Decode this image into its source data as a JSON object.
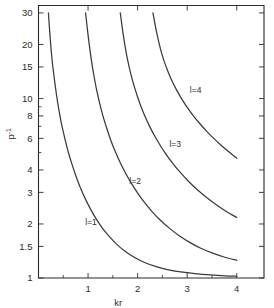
{
  "chart_data": {
    "type": "line",
    "title": "",
    "xlabel": "kr",
    "ylabel": "p⁻¹",
    "ylabel_base": "p",
    "ylabel_exponent": "-1",
    "xscale": "linear",
    "yscale": "log",
    "xlim": [
      0,
      4.55
    ],
    "ylim": [
      1,
      33
    ],
    "grid": false,
    "legend_position": "inline-curve-labels",
    "x_ticks_major": [
      1,
      2,
      3,
      4
    ],
    "x_tick_labels": [
      "1",
      "2",
      "3",
      "4"
    ],
    "x_ticks_minor": [
      0.5,
      1.5,
      2.5,
      3.5
    ],
    "y_ticks_major": [
      1,
      1.5,
      2,
      3,
      4,
      6,
      8,
      10,
      15,
      20,
      30
    ],
    "y_tick_labels": [
      "1",
      "1.5",
      "2",
      "3",
      "4",
      "6",
      "8",
      "10",
      "15",
      "20",
      "30"
    ],
    "y_ticks_minor": [
      5,
      7,
      9
    ],
    "series": [
      {
        "name": "l=1",
        "label": "l=1",
        "label_x": 1.06,
        "label_y": 2.05,
        "points": [
          [
            0.2,
            30.0
          ],
          [
            0.215,
            26.0
          ],
          [
            0.235,
            22.0
          ],
          [
            0.26,
            18.0
          ],
          [
            0.29,
            15.0
          ],
          [
            0.325,
            12.5
          ],
          [
            0.365,
            10.4
          ],
          [
            0.41,
            8.7
          ],
          [
            0.465,
            7.2
          ],
          [
            0.525,
            6.1
          ],
          [
            0.595,
            5.1
          ],
          [
            0.67,
            4.35
          ],
          [
            0.755,
            3.7
          ],
          [
            0.845,
            3.18
          ],
          [
            0.945,
            2.76
          ],
          [
            1.05,
            2.42
          ],
          [
            1.17,
            2.12
          ],
          [
            1.3,
            1.88
          ],
          [
            1.44,
            1.69
          ],
          [
            1.59,
            1.53
          ],
          [
            1.76,
            1.4
          ],
          [
            1.94,
            1.3
          ],
          [
            2.14,
            1.22
          ],
          [
            2.36,
            1.16
          ],
          [
            2.6,
            1.115
          ],
          [
            2.87,
            1.082
          ],
          [
            3.16,
            1.058
          ],
          [
            3.47,
            1.04
          ],
          [
            3.76,
            1.028
          ],
          [
            4.0,
            1.022
          ]
        ]
      },
      {
        "name": "l=2",
        "label": "l=2",
        "label_x": 1.95,
        "label_y": 3.45,
        "points": [
          [
            0.95,
            30.0
          ],
          [
            0.975,
            26.0
          ],
          [
            1.005,
            22.0
          ],
          [
            1.04,
            18.5
          ],
          [
            1.08,
            15.5
          ],
          [
            1.125,
            13.1
          ],
          [
            1.175,
            11.1
          ],
          [
            1.235,
            9.4
          ],
          [
            1.3,
            8.0
          ],
          [
            1.375,
            6.85
          ],
          [
            1.455,
            5.9
          ],
          [
            1.545,
            5.1
          ],
          [
            1.645,
            4.42
          ],
          [
            1.755,
            3.85
          ],
          [
            1.875,
            3.37
          ],
          [
            2.005,
            2.96
          ],
          [
            2.145,
            2.62
          ],
          [
            2.3,
            2.33
          ],
          [
            2.465,
            2.09
          ],
          [
            2.645,
            1.89
          ],
          [
            2.84,
            1.72
          ],
          [
            3.05,
            1.58
          ],
          [
            3.275,
            1.465
          ],
          [
            3.515,
            1.375
          ],
          [
            3.76,
            1.305
          ],
          [
            4.0,
            1.255
          ]
        ]
      },
      {
        "name": "l=3",
        "label": "l=3",
        "label_x": 2.76,
        "label_y": 5.55,
        "points": [
          [
            1.65,
            30.0
          ],
          [
            1.68,
            26.0
          ],
          [
            1.715,
            22.2
          ],
          [
            1.755,
            19.0
          ],
          [
            1.8,
            16.3
          ],
          [
            1.855,
            14.0
          ],
          [
            1.915,
            12.1
          ],
          [
            1.985,
            10.5
          ],
          [
            2.06,
            9.15
          ],
          [
            2.145,
            8.0
          ],
          [
            2.24,
            7.02
          ],
          [
            2.345,
            6.18
          ],
          [
            2.46,
            5.46
          ],
          [
            2.585,
            4.84
          ],
          [
            2.72,
            4.31
          ],
          [
            2.87,
            3.85
          ],
          [
            3.03,
            3.45
          ],
          [
            3.2,
            3.11
          ],
          [
            3.385,
            2.82
          ],
          [
            3.58,
            2.57
          ],
          [
            3.79,
            2.35
          ],
          [
            4.0,
            2.175
          ]
        ]
      },
      {
        "name": "l=4",
        "label": "l=4",
        "label_x": 3.17,
        "label_y": 11.2,
        "points": [
          [
            2.31,
            30.0
          ],
          [
            2.345,
            26.5
          ],
          [
            2.385,
            23.3
          ],
          [
            2.43,
            20.5
          ],
          [
            2.48,
            18.1
          ],
          [
            2.54,
            16.0
          ],
          [
            2.61,
            14.2
          ],
          [
            2.69,
            12.6
          ],
          [
            2.78,
            11.25
          ],
          [
            2.88,
            10.05
          ],
          [
            2.99,
            9.02
          ],
          [
            3.11,
            8.12
          ],
          [
            3.24,
            7.33
          ],
          [
            3.38,
            6.63
          ],
          [
            3.53,
            6.02
          ],
          [
            3.69,
            5.48
          ],
          [
            3.84,
            5.05
          ],
          [
            4.0,
            4.65
          ]
        ]
      }
    ]
  }
}
